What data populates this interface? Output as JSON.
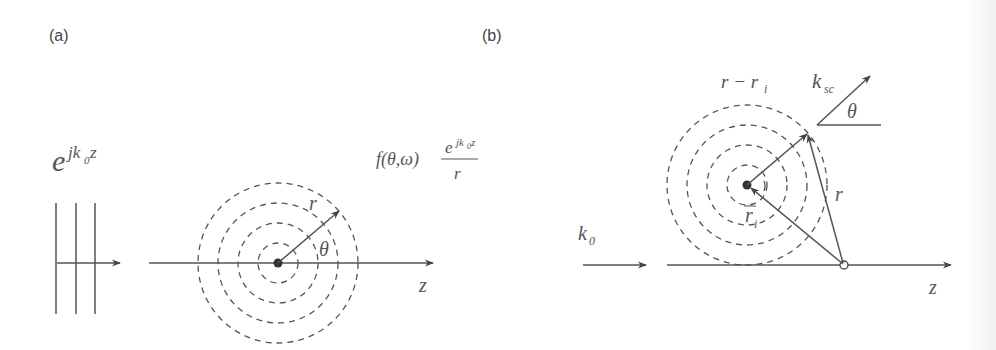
{
  "figure": {
    "panel_a": {
      "label": "(a)",
      "incident_wave": {
        "base": "e",
        "exponent": "jk",
        "exponent_sub": "0",
        "exponent_tail": "z"
      },
      "scattered_wave": {
        "prefix": "f(θ,ω)",
        "numerator_base": "e",
        "numerator_exp": "jk",
        "numerator_exp_sub": "0",
        "numerator_exp_tail": "z",
        "denominator": "r"
      },
      "radius_label": "r",
      "angle_label": "θ",
      "axis_label": "z",
      "wavefront_lines": 3,
      "dashed_circles": 4
    },
    "panel_b": {
      "label": "(b)",
      "incident_label": "k",
      "incident_label_sub": "0",
      "scatter_vector_label": "k",
      "scatter_vector_sub": "sc",
      "angle_label": "θ",
      "distance_label": "r − r",
      "distance_label_sub": "i",
      "position_label": "r",
      "position_label_sub": "i",
      "observer_label": "r",
      "axis_label": "z",
      "dashed_circles": 4
    }
  }
}
